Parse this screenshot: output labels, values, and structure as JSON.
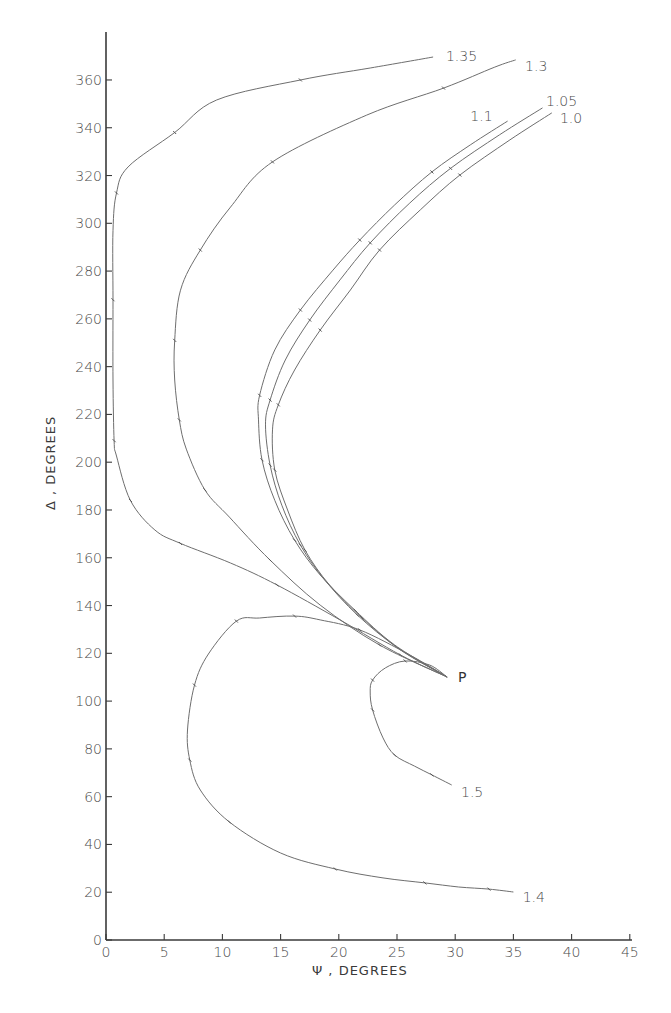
{
  "chart_data": {
    "type": "line",
    "title": "",
    "xlabel": "Ψ , DEGREES",
    "ylabel": "Δ , DEGREES",
    "xlim": [
      0,
      45
    ],
    "ylim": [
      0,
      380
    ],
    "x_ticks": [
      0,
      5,
      10,
      15,
      20,
      25,
      30,
      35,
      40,
      45
    ],
    "y_ticks": [
      0,
      20,
      40,
      60,
      80,
      100,
      120,
      140,
      160,
      180,
      200,
      220,
      240,
      260,
      280,
      300,
      320,
      340,
      360
    ],
    "grid": false,
    "legend": "none (curves labeled at their endpoints)",
    "annotations": [
      {
        "text": "P",
        "x": 29.3,
        "y": 110
      }
    ],
    "series": [
      {
        "name": "1.35",
        "label_pos": [
          29.2,
          370
        ],
        "points": [
          [
            28.1,
            369.6
          ],
          [
            22.7,
            365
          ],
          [
            16.7,
            360
          ],
          [
            9.5,
            351.6
          ],
          [
            5.9,
            338
          ],
          [
            1.9,
            323.6
          ],
          [
            0.9,
            312.7
          ],
          [
            0.6,
            297
          ],
          [
            0.6,
            268
          ],
          [
            0.6,
            234
          ],
          [
            0.7,
            209
          ],
          [
            0.9,
            202.6
          ],
          [
            2.1,
            184
          ],
          [
            4.2,
            171.6
          ],
          [
            6.4,
            166
          ],
          [
            10.7,
            157.8
          ],
          [
            14.7,
            148.6
          ],
          [
            20.1,
            134
          ],
          [
            25.3,
            119.3
          ],
          [
            29.3,
            110.1
          ]
        ]
      },
      {
        "name": "1.3",
        "label_pos": [
          36.0,
          366
        ],
        "points": [
          [
            35.2,
            368.4
          ],
          [
            33.4,
            365.4
          ],
          [
            29.0,
            356.6
          ],
          [
            22.4,
            345.3
          ],
          [
            14.3,
            325.7
          ],
          [
            10.7,
            306.8
          ],
          [
            8.1,
            288.8
          ],
          [
            6.4,
            272
          ],
          [
            5.9,
            251
          ],
          [
            5.9,
            234.4
          ],
          [
            6.3,
            217.7
          ],
          [
            6.9,
            205.5
          ],
          [
            8.5,
            188.4
          ],
          [
            10.6,
            177
          ],
          [
            14.1,
            159
          ],
          [
            18.4,
            140.2
          ],
          [
            23.5,
            123.5
          ],
          [
            29.3,
            110.1
          ]
        ]
      },
      {
        "name": "1.1",
        "label_pos": [
          31.3,
          345
        ],
        "points": [
          [
            34.5,
            342.8
          ],
          [
            31.3,
            332.8
          ],
          [
            28.0,
            321.5
          ],
          [
            24.8,
            307.7
          ],
          [
            21.8,
            293
          ],
          [
            19.5,
            280.4
          ],
          [
            16.7,
            263.7
          ],
          [
            14.5,
            247
          ],
          [
            13.2,
            228
          ],
          [
            13.1,
            217.7
          ],
          [
            13.4,
            201
          ],
          [
            14.5,
            184
          ],
          [
            16.2,
            167.4
          ],
          [
            18.4,
            152.8
          ],
          [
            21.4,
            138
          ],
          [
            24.8,
            123.5
          ],
          [
            29.3,
            110.1
          ]
        ]
      },
      {
        "name": "1.05",
        "label_pos": [
          37.8,
          351
        ],
        "points": [
          [
            37.5,
            348.3
          ],
          [
            33.8,
            337
          ],
          [
            29.6,
            323
          ],
          [
            26.1,
            308.5
          ],
          [
            22.7,
            291.8
          ],
          [
            20.1,
            276.3
          ],
          [
            17.5,
            259.5
          ],
          [
            15.4,
            242.8
          ],
          [
            14.1,
            226
          ],
          [
            13.7,
            215.6
          ],
          [
            14.1,
            198.8
          ],
          [
            15.1,
            182
          ],
          [
            16.7,
            165.3
          ],
          [
            18.8,
            150.7
          ],
          [
            21.6,
            136
          ],
          [
            25.1,
            122.2
          ],
          [
            29.3,
            110.1
          ]
        ]
      },
      {
        "name": "1.0",
        "label_pos": [
          39.0,
          344
        ],
        "points": [
          [
            38.3,
            346.2
          ],
          [
            34.7,
            334.9
          ],
          [
            30.4,
            320.2
          ],
          [
            27.0,
            305.6
          ],
          [
            23.5,
            288.8
          ],
          [
            21.0,
            272.1
          ],
          [
            18.4,
            255.3
          ],
          [
            16.2,
            238.6
          ],
          [
            14.8,
            224
          ],
          [
            14.3,
            213.5
          ],
          [
            14.5,
            196.7
          ],
          [
            15.6,
            180
          ],
          [
            17.1,
            163.2
          ],
          [
            19.2,
            148.6
          ],
          [
            22.0,
            134.8
          ],
          [
            25.3,
            121.4
          ],
          [
            29.3,
            110.1
          ]
        ]
      },
      {
        "name": "1.4",
        "label_pos": [
          35.8,
          18
        ],
        "points": [
          [
            29.3,
            110.1
          ],
          [
            26.1,
            119.3
          ],
          [
            21.8,
            129.8
          ],
          [
            18.4,
            134
          ],
          [
            16.2,
            135.6
          ],
          [
            13.2,
            134.8
          ],
          [
            11.2,
            133.5
          ],
          [
            8.8,
            119.7
          ],
          [
            7.6,
            106.7
          ],
          [
            7.0,
            87.9
          ],
          [
            7.2,
            75.3
          ],
          [
            8.1,
            62.8
          ],
          [
            10.6,
            49.4
          ],
          [
            15.0,
            36.4
          ],
          [
            19.7,
            29.7
          ],
          [
            23.8,
            26
          ],
          [
            27.4,
            23.9
          ],
          [
            30.3,
            22.2
          ],
          [
            32.9,
            21.3
          ],
          [
            35.0,
            20.1
          ]
        ]
      },
      {
        "name": "1.5",
        "label_pos": [
          30.5,
          62
        ],
        "points": [
          [
            29.3,
            110.1
          ],
          [
            27.8,
            115.1
          ],
          [
            25.7,
            116.8
          ],
          [
            24.0,
            113.9
          ],
          [
            22.9,
            108.8
          ],
          [
            22.7,
            103.8
          ],
          [
            22.9,
            96.3
          ],
          [
            23.8,
            84.6
          ],
          [
            24.8,
            77.4
          ],
          [
            26.5,
            72.8
          ],
          [
            28.0,
            69.1
          ],
          [
            29.7,
            64.9
          ]
        ]
      }
    ]
  },
  "labels": {
    "x_axis_title": "Ψ , DEGREES",
    "y_axis_title": "Δ , DEGREES",
    "point_p": "P"
  },
  "style": {
    "curve_color": "#6e6e6e",
    "axis_color": "#3a3a3a",
    "text_color": "#4a4a4a"
  }
}
